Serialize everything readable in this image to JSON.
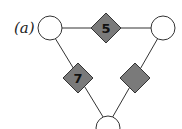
{
  "figure": {
    "label": "(a)",
    "colors": {
      "diamond_fill": "#7a7a7a",
      "stroke": "#333333",
      "node_fill": "#ffffff"
    },
    "nodes": [
      {
        "id": "left",
        "shape": "circle"
      },
      {
        "id": "right",
        "shape": "circle"
      },
      {
        "id": "bottom",
        "shape": "circle"
      }
    ],
    "factors": [
      {
        "id": "top",
        "shape": "diamond",
        "value": "5"
      },
      {
        "id": "left",
        "shape": "diamond",
        "value": "7"
      },
      {
        "id": "right",
        "shape": "diamond",
        "value": ""
      }
    ]
  }
}
